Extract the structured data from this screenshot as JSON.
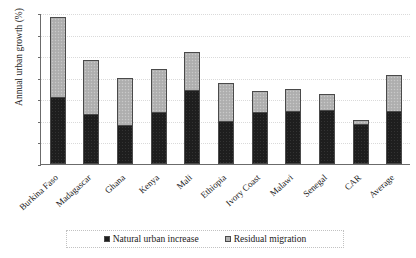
{
  "chart_data": {
    "type": "bar",
    "stacked": true,
    "title": "",
    "subtitle": "",
    "xlabel": "",
    "ylabel": "Annual urban growth (%)",
    "ylim": [
      0,
      7
    ],
    "ytick_labels": [
      "0",
      "1",
      "2",
      "3",
      "4",
      "5",
      "6",
      "7"
    ],
    "grid": true,
    "legend_position": "bottom",
    "categories": [
      "Burkina Faso",
      "Madagascar",
      "Ghana",
      "Kenya",
      "Mali",
      "Ethiopia",
      "Ivory Coast",
      "Malawi",
      "Senegal",
      "CAR",
      "Average"
    ],
    "series": [
      {
        "name": "Natural urban increase",
        "color": "#1e1e1e",
        "values": [
          3.1,
          2.3,
          1.8,
          2.4,
          3.45,
          2.0,
          2.4,
          2.45,
          2.5,
          1.85,
          2.45
        ]
      },
      {
        "name": "Residual migration",
        "color": "#b2b2b2",
        "values": [
          3.7,
          2.5,
          2.2,
          2.0,
          1.75,
          1.75,
          1.0,
          1.05,
          0.75,
          0.2,
          1.7
        ]
      }
    ],
    "totals": [
      6.8,
      4.8,
      4.0,
      4.4,
      5.2,
      3.75,
      3.4,
      3.5,
      3.25,
      2.05,
      4.15
    ]
  },
  "legend": {
    "entries": [
      {
        "label": "Natural urban increase"
      },
      {
        "label": "Residual migration"
      }
    ]
  }
}
